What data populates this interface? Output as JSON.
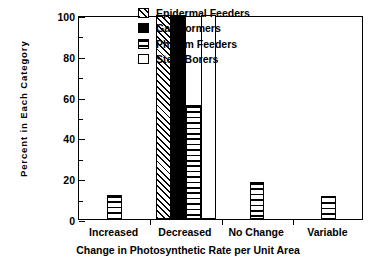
{
  "chart_data": {
    "type": "bar",
    "title": "",
    "subtitle": "",
    "xlabel": "Change in Photosynthetic Rate per Unit Area",
    "ylabel": "Percent  in  Each  Category",
    "categories": [
      "Increased",
      "Decreased",
      "No Change",
      "Variable"
    ],
    "ylim": [
      0,
      100
    ],
    "yticks": [
      0,
      20,
      40,
      60,
      80,
      100
    ],
    "ytick_labels": [
      "0",
      "20",
      "40",
      "60",
      "80",
      "100"
    ],
    "yminor_ticks": [
      10,
      30,
      50,
      70,
      90
    ],
    "grid": false,
    "legend_position": "top-right-inside",
    "series": [
      {
        "name": "Epidermal Feeders",
        "pattern": "diagonal-hatch",
        "color": "#000000",
        "values": [
          0,
          100,
          0,
          0
        ]
      },
      {
        "name": "Gall Formers",
        "pattern": "solid-black",
        "color": "#000000",
        "values": [
          0,
          100,
          0,
          0
        ]
      },
      {
        "name": "Phloem Feeders",
        "pattern": "horizontal-lines",
        "color": "#000000",
        "values": [
          12,
          56,
          18,
          11.5
        ]
      },
      {
        "name": "Stem Borers",
        "pattern": "empty-white",
        "color": "#ffffff",
        "values": [
          0,
          100,
          0,
          0
        ]
      }
    ],
    "annotations": []
  },
  "legend": {
    "items": [
      {
        "label": "Epidermal Feeders",
        "pattern": "diagonal-hatch"
      },
      {
        "label": "Gall Formers",
        "pattern": "solid-black"
      },
      {
        "label": "Phloem Feeders",
        "pattern": "horizontal-lines"
      },
      {
        "label": "Stem Borers",
        "pattern": "empty-white"
      }
    ]
  }
}
